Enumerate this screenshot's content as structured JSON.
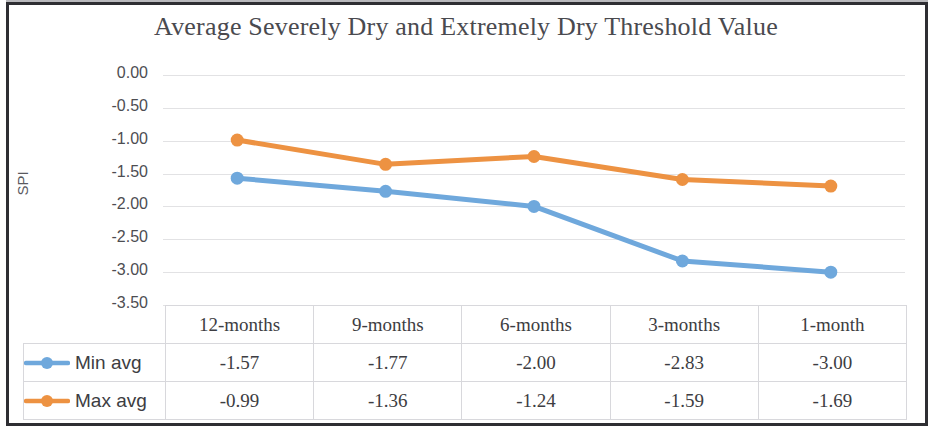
{
  "chart_data": {
    "type": "line",
    "title": "Average Severely Dry and Extremely Dry Threshold Value",
    "xlabel": "",
    "ylabel": "SPI",
    "categories": [
      "12-months",
      "9-months",
      "6-months",
      "3-months",
      "1-month"
    ],
    "series": [
      {
        "name": "Min avg",
        "values": [
          -1.57,
          -1.77,
          -2.0,
          -2.83,
          -3.0
        ],
        "color": "#6FA8DC"
      },
      {
        "name": "Max avg",
        "values": [
          -0.99,
          -1.36,
          -1.24,
          -1.59,
          -1.69
        ],
        "color": "#ED9242"
      }
    ],
    "ylim": [
      -3.5,
      0.0
    ],
    "ytick_labels": [
      "0.00",
      "-0.50",
      "-1.00",
      "-1.50",
      "-2.00",
      "-2.50",
      "-3.00",
      "-3.50"
    ],
    "ytick_values": [
      0.0,
      -0.5,
      -1.0,
      -1.5,
      -2.0,
      -2.5,
      -3.0,
      -3.5
    ],
    "grid": "horizontal",
    "legend_position": "data-table-left",
    "marker": "circle"
  },
  "table": {
    "headers": [
      "12-months",
      "9-months",
      "6-months",
      "3-months",
      "1-month"
    ],
    "rows": [
      {
        "label": "Min avg",
        "values": [
          "-1.57",
          "-1.77",
          "-2.00",
          "-2.83",
          "-3.00"
        ]
      },
      {
        "label": "Max avg",
        "values": [
          "-0.99",
          "-1.36",
          "-1.24",
          "-1.59",
          "-1.69"
        ]
      }
    ]
  }
}
